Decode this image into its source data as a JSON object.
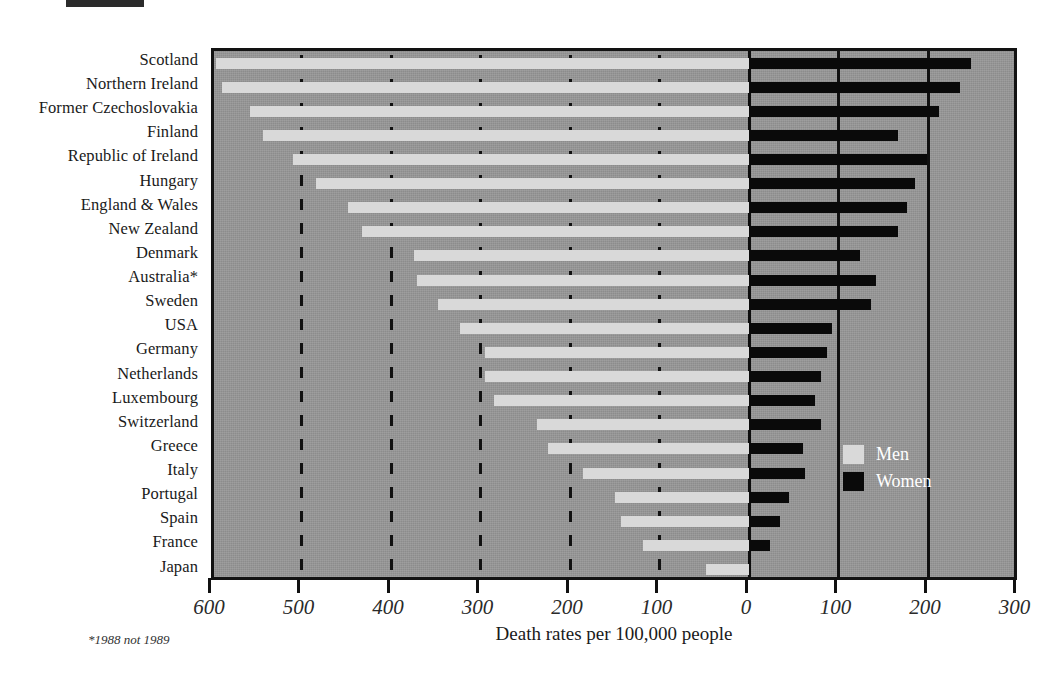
{
  "chart_data": {
    "type": "bar",
    "orientation": "horizontal",
    "subtype": "bidirectional-paired-bar",
    "title": "",
    "xlabel": "Death rates per 100,000 people",
    "ylabel": "",
    "footnote": "*1988 not 1989",
    "grid": true,
    "legend_position": "inside-right",
    "xlim": [
      -650,
      300
    ],
    "left_axis_label": "Men",
    "right_axis_label": "Women",
    "tick_labels": [
      "600",
      "500",
      "400",
      "300",
      "200",
      "100",
      "0",
      "100",
      "200",
      "300"
    ],
    "tick_values": [
      -600,
      -500,
      -400,
      -300,
      -200,
      -100,
      0,
      100,
      200,
      300
    ],
    "categories": [
      "Scotland",
      "Northern Ireland",
      "Former Czechoslovakia",
      "Finland",
      "Republic of Ireland",
      "Hungary",
      "England & Wales",
      "New Zealand",
      "Denmark",
      "Australia*",
      "Sweden",
      "USA",
      "Germany",
      "Netherlands",
      "Luxembourg",
      "Switzerland",
      "Greece",
      "Italy",
      "Portugal",
      "Spain",
      "France",
      "Japan"
    ],
    "series": [
      {
        "name": "Men",
        "color": "#d9d9d9",
        "side": "left",
        "values": [
          595,
          589,
          558,
          543,
          509,
          484,
          448,
          432,
          374,
          371,
          347,
          323,
          295,
          295,
          285,
          237,
          225,
          185,
          150,
          143,
          118,
          48
        ]
      },
      {
        "name": "Women",
        "color": "#0a0a0a",
        "side": "right",
        "values": [
          248,
          236,
          212,
          167,
          199,
          185,
          176,
          167,
          124,
          142,
          136,
          93,
          87,
          81,
          74,
          80,
          60,
          63,
          45,
          35,
          24,
          0
        ]
      }
    ]
  },
  "legend": {
    "entries": [
      {
        "label": "Men",
        "swatch": "men"
      },
      {
        "label": "Women",
        "swatch": "women"
      }
    ]
  },
  "axis": {
    "title": "Death rates per 100,000 people"
  },
  "footnote": {
    "text": "*1988 not 1989"
  }
}
